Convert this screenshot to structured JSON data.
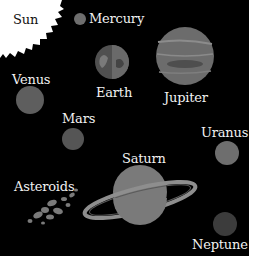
{
  "diagram": {
    "background": "#000000",
    "bodies": [
      {
        "name": "Sun",
        "label": "Sun",
        "color": "#ffffff"
      },
      {
        "name": "Mercury",
        "label": "Mercury",
        "color": "#6e6e6e"
      },
      {
        "name": "Venus",
        "label": "Venus",
        "color": "#5e5e5e"
      },
      {
        "name": "Earth",
        "label": "Earth",
        "color": "#5a5a5a"
      },
      {
        "name": "Mars",
        "label": "Mars",
        "color": "#555555"
      },
      {
        "name": "Jupiter",
        "label": "Jupiter",
        "color": "#707070"
      },
      {
        "name": "Saturn",
        "label": "Saturn",
        "color": "#7a7a7a"
      },
      {
        "name": "Uranus",
        "label": "Uranus",
        "color": "#6e6e6e"
      },
      {
        "name": "Neptune",
        "label": "Neptune",
        "color": "#3c3c3c"
      },
      {
        "name": "Asteroids",
        "label": "Asteroids",
        "color": "#7a7a7a"
      }
    ]
  }
}
